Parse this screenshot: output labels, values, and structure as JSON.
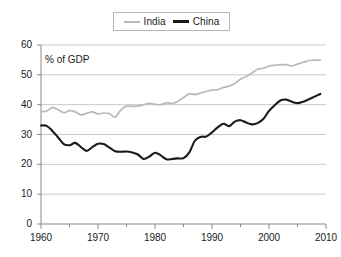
{
  "chart_data": {
    "type": "line",
    "title": "",
    "subtitle": "",
    "annotation": "% of GDP",
    "xlabel": "",
    "ylabel": "",
    "xlim": [
      1960,
      2010
    ],
    "ylim": [
      0,
      60
    ],
    "xticks": [
      1960,
      1970,
      1980,
      1990,
      2000,
      2010
    ],
    "xminor_ticks": [
      1965,
      1975,
      1985,
      1995,
      2005
    ],
    "yticks": [
      0,
      10,
      20,
      30,
      40,
      50,
      60
    ],
    "grid": "horizontal",
    "legend_position": "top-center",
    "colors": {
      "india": "#b9b9b9",
      "china": "#1a1a1a",
      "grid": "#c9c9c9",
      "axis": "#8a8a8a"
    },
    "x": [
      1960,
      1961,
      1962,
      1963,
      1964,
      1965,
      1966,
      1967,
      1968,
      1969,
      1970,
      1971,
      1972,
      1973,
      1974,
      1975,
      1976,
      1977,
      1978,
      1979,
      1980,
      1981,
      1982,
      1983,
      1984,
      1985,
      1986,
      1987,
      1988,
      1989,
      1990,
      1991,
      1992,
      1993,
      1994,
      1995,
      1996,
      1997,
      1998,
      1999,
      2000,
      2001,
      2002,
      2003,
      2004,
      2005,
      2006,
      2007,
      2008,
      2009
    ],
    "series": [
      {
        "name": "India",
        "color": "#b9b9b9",
        "values": [
          37.6,
          37.9,
          39.0,
          38.3,
          37.3,
          38.0,
          37.6,
          36.6,
          37.1,
          37.6,
          36.9,
          37.2,
          37.0,
          35.8,
          38.2,
          39.5,
          39.4,
          39.5,
          40.0,
          40.4,
          40.1,
          40.0,
          40.6,
          40.4,
          41.1,
          42.4,
          43.6,
          43.4,
          43.9,
          44.4,
          44.9,
          45.0,
          45.8,
          46.2,
          47.1,
          48.5,
          49.4,
          50.6,
          51.9,
          52.2,
          52.9,
          53.2,
          53.4,
          53.4,
          53.0,
          53.6,
          54.2,
          54.8,
          54.9,
          54.9
        ]
      },
      {
        "name": "China",
        "color": "#1a1a1a",
        "values": [
          33.0,
          32.9,
          31.2,
          29.0,
          26.8,
          26.4,
          27.2,
          25.8,
          24.5,
          25.8,
          26.9,
          26.8,
          25.6,
          24.4,
          24.2,
          24.3,
          24.0,
          23.3,
          21.8,
          22.6,
          23.9,
          23.0,
          21.7,
          21.8,
          22.0,
          22.1,
          23.9,
          27.9,
          29.2,
          29.3,
          30.7,
          32.4,
          33.6,
          32.8,
          34.3,
          34.8,
          34.0,
          33.4,
          33.8,
          35.2,
          37.9,
          39.8,
          41.4,
          41.7,
          41.0,
          40.5,
          41.0,
          41.8,
          42.7,
          43.6
        ]
      }
    ]
  }
}
